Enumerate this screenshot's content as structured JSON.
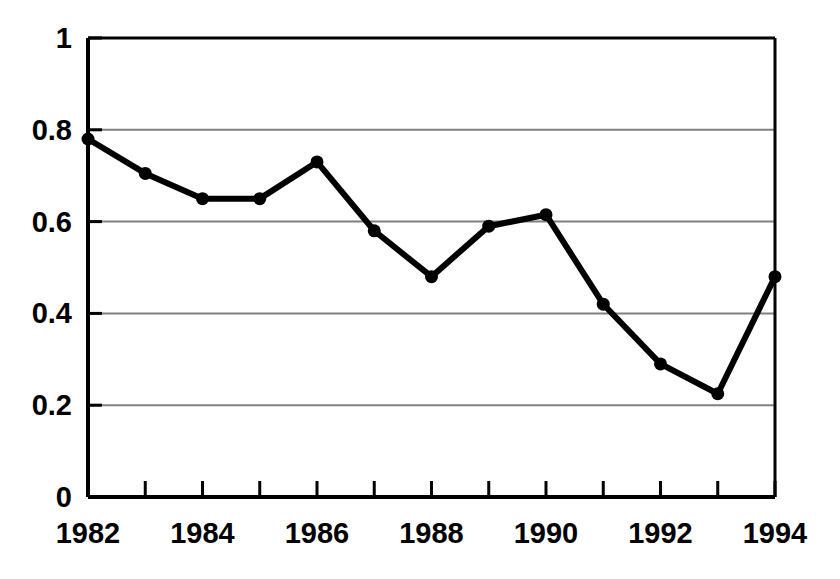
{
  "chart_data": {
    "type": "line",
    "title": "",
    "subtitle": "",
    "xlabel": "",
    "ylabel": "",
    "x": [
      1982,
      1983,
      1984,
      1985,
      1986,
      1987,
      1988,
      1989,
      1990,
      1991,
      1992,
      1993,
      1994
    ],
    "values": [
      0.78,
      0.705,
      0.65,
      0.65,
      0.73,
      0.58,
      0.48,
      0.59,
      0.615,
      0.42,
      0.29,
      0.225,
      0.48
    ],
    "series": [
      {
        "name": "",
        "values": [
          0.78,
          0.705,
          0.65,
          0.65,
          0.73,
          0.58,
          0.48,
          0.59,
          0.615,
          0.42,
          0.29,
          0.225,
          0.48
        ]
      }
    ],
    "xlim": [
      1982,
      1994
    ],
    "ylim": [
      0,
      1
    ],
    "ytick_values": [
      0,
      0.2,
      0.4,
      0.6,
      0.8,
      1
    ],
    "ytick_labels": [
      "0",
      "0.2",
      "0.4",
      "0.6",
      "0.8",
      "1"
    ],
    "xtick_values": [
      1982,
      1984,
      1986,
      1988,
      1990,
      1992,
      1994
    ],
    "xtick_labels": [
      "1982",
      "1984",
      "1986",
      "1988",
      "1990",
      "1992",
      "1994"
    ],
    "grid": "horizontal",
    "legend": "none",
    "marker": "filled-circle",
    "line_color": "#000000",
    "marker_color": "#000000",
    "grid_color": "#808080",
    "axis_color": "#000000",
    "background_color": "#ffffff"
  }
}
